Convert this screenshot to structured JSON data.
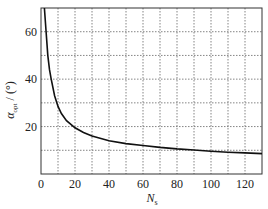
{
  "chart_data": {
    "type": "line",
    "title": "",
    "xlabel": "N_s",
    "xlabel_main": "N",
    "xlabel_sub": "s",
    "ylabel": "α_opt / (°)",
    "ylabel_main": "α",
    "ylabel_sub": "opt",
    "ylabel_unit": " / (°)",
    "xlim": [
      0,
      130
    ],
    "ylim": [
      0,
      70
    ],
    "xticks": [
      0,
      20,
      40,
      60,
      80,
      100,
      120
    ],
    "yticks": [
      20,
      40,
      60
    ],
    "x_grid_step": 10,
    "y_grid_step": 10,
    "grid": true,
    "grid_style": "dotted",
    "legend": null,
    "series": [
      {
        "name": "alpha_opt",
        "x": [
          2,
          3,
          4,
          5,
          6,
          8,
          10,
          12,
          15,
          20,
          25,
          30,
          40,
          50,
          60,
          70,
          80,
          90,
          100,
          110,
          120,
          130
        ],
        "y": [
          70,
          60,
          50,
          44,
          40,
          33,
          28.5,
          25.5,
          22.5,
          19.5,
          17.5,
          16,
          14,
          12.8,
          12,
          11.2,
          10.6,
          10.1,
          9.6,
          9.2,
          8.9,
          8.6
        ]
      }
    ]
  }
}
